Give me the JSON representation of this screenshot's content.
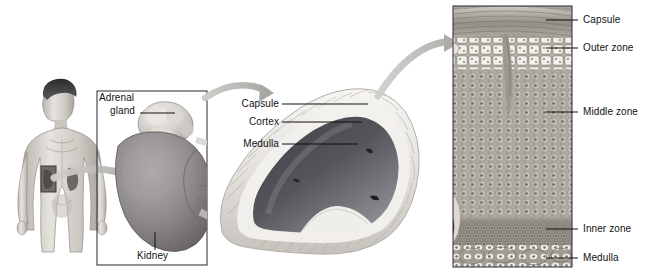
{
  "figure": {
    "background_color": "#ffffff",
    "label_color": "#111111",
    "panels": [
      {
        "name": "body-panel",
        "caption": "Human body with kidney location"
      },
      {
        "name": "kidney-inset-panel",
        "caption": "Kidney and adrenal gland"
      },
      {
        "name": "gland-section-panel",
        "caption": "Adrenal gland cross section"
      },
      {
        "name": "histology-panel",
        "caption": "Adrenal cortex histology"
      }
    ]
  },
  "labels": {
    "adrenal_gland": "Adrenal\ngland",
    "adrenal_gland_line1": "Adrenal",
    "adrenal_gland_line2": "gland",
    "kidney": "Kidney",
    "capsule_mid": "Capsule",
    "cortex": "Cortex",
    "medulla_mid": "Medulla",
    "capsule_right": "Capsule",
    "outer_zone": "Outer zone",
    "middle_zone": "Middle zone",
    "inner_zone": "Inner zone",
    "medulla_right": "Medulla"
  },
  "colors": {
    "capsule_fill": "#e8e6e3",
    "cortex_fill": "#efedea",
    "medulla_dark": "#4a4a4f",
    "medulla_light": "#8d8d93",
    "kidney_fill": "#8e8a8c",
    "gland_fill": "#cfccc8",
    "arrow_gray": "#b9b7b4",
    "box_stroke": "#3a3a44",
    "tissue_bg": "#b9b5ae",
    "capsule_band": "#8f8a82",
    "outer_cells": "#f0eee9",
    "inner_band": "#908b83"
  }
}
